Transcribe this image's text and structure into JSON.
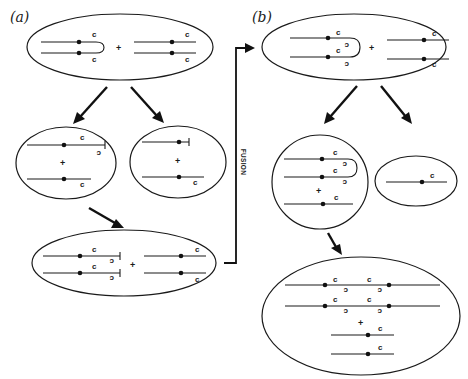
{
  "panels": {
    "a": {
      "label": "(a)"
    },
    "b": {
      "label": "(b)"
    }
  },
  "labels": {
    "centromere_letter": "c",
    "plus": "+",
    "fusion": "FUSION"
  },
  "colors": {
    "ink": "#1a1a1a",
    "background": "#ffffff"
  }
}
